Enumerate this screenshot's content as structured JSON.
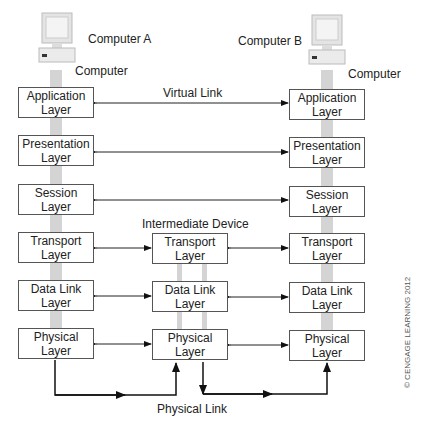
{
  "diagram": {
    "computer_a": {
      "name": "Computer A",
      "caption": "Computer"
    },
    "computer_b": {
      "name": "Computer B",
      "caption": "Computer"
    },
    "intermediate_label": "Intermediate Device",
    "virtual_link_label": "Virtual Link",
    "physical_link_label": "Physical Link",
    "copyright": "© CENGAGE LEARNING 2012",
    "left_layers": [
      {
        "line1": "Application",
        "line2": "Layer"
      },
      {
        "line1": "Presentation",
        "line2": "Layer"
      },
      {
        "line1": "Session",
        "line2": "Layer"
      },
      {
        "line1": "Transport",
        "line2": "Layer"
      },
      {
        "line1": "Data Link",
        "line2": "Layer"
      },
      {
        "line1": "Physical",
        "line2": "Layer"
      }
    ],
    "middle_layers": [
      {
        "line1": "Transport",
        "line2": "Layer"
      },
      {
        "line1": "Data Link",
        "line2": "Layer"
      },
      {
        "line1": "Physical",
        "line2": "Layer"
      }
    ],
    "right_layers": [
      {
        "line1": "Application",
        "line2": "Layer"
      },
      {
        "line1": "Presentation",
        "line2": "Layer"
      },
      {
        "line1": "Session",
        "line2": "Layer"
      },
      {
        "line1": "Transport",
        "line2": "Layer"
      },
      {
        "line1": "Data Link",
        "line2": "Layer"
      },
      {
        "line1": "Physical",
        "line2": "Layer"
      }
    ]
  }
}
